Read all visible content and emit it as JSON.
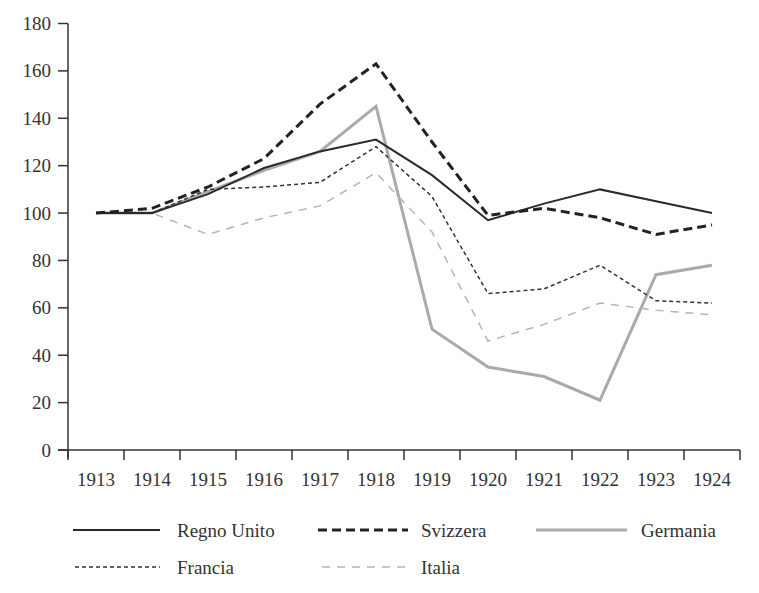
{
  "chart_data": {
    "type": "line",
    "title": "",
    "xlabel": "",
    "ylabel": "",
    "ylim": [
      0,
      180
    ],
    "yticks": [
      0,
      20,
      40,
      60,
      80,
      100,
      120,
      140,
      160,
      180
    ],
    "categories": [
      "1913",
      "1914",
      "1915",
      "1916",
      "1917",
      "1918",
      "1919",
      "1920",
      "1921",
      "1922",
      "1923",
      "1924"
    ],
    "grid": false,
    "legend_position": "bottom",
    "series": [
      {
        "name": "Regno Unito",
        "style": "solid",
        "color": "#2a2a2a",
        "width": 2,
        "values": [
          100,
          100,
          108,
          119,
          126,
          131,
          116,
          97,
          104,
          110,
          105,
          100
        ]
      },
      {
        "name": "Svizzera",
        "style": "bold-dashed",
        "color": "#222222",
        "width": 3,
        "values": [
          100,
          102,
          111,
          123,
          146,
          163,
          130,
          99,
          102,
          98,
          91,
          95
        ]
      },
      {
        "name": "Germania",
        "style": "solid-grey",
        "color": "#aaaaaa",
        "width": 3,
        "values": [
          100,
          100,
          109,
          118,
          126,
          145,
          51,
          35,
          31,
          21,
          74,
          78
        ]
      },
      {
        "name": "Francia",
        "style": "fine-dashed",
        "color": "#333333",
        "width": 1.5,
        "values": [
          100,
          100,
          110,
          111,
          113,
          128,
          107,
          66,
          68,
          78,
          63,
          62
        ]
      },
      {
        "name": "Italia",
        "style": "grey-dashed",
        "color": "#b5b5b5",
        "width": 1.5,
        "values": [
          100,
          100,
          91,
          98,
          103,
          117,
          92,
          46,
          53,
          62,
          59,
          57
        ]
      }
    ]
  }
}
